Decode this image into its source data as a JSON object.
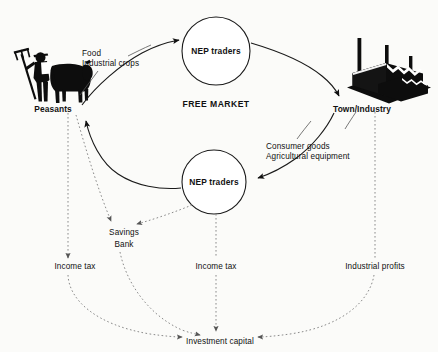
{
  "diagram": {
    "colors": {
      "ink": "#111111",
      "line": "#1a1a1a",
      "dotted": "#8a8a8a",
      "background": "#fbfbf9"
    },
    "center_label": "FREE MARKET",
    "nodes": {
      "peasants": "Peasants",
      "town_industry": "Town/Industry",
      "nep_traders_top": "NEP traders",
      "nep_traders_bottom": "NEP traders",
      "savings_bank_line1": "Savings",
      "savings_bank_line2": "Bank",
      "investment_capital": "Investment capital"
    },
    "flow_labels": {
      "food": "Food",
      "industrial_crops": "Industrial crops",
      "consumer_goods": "Consumer goods",
      "agricultural_equipment": "Agricultural equipment",
      "income_tax_left": "Income tax",
      "income_tax_center": "Income tax",
      "industrial_profits": "Industrial profits"
    },
    "icons": {
      "peasant": "peasant-with-pitchfork-and-ox-icon",
      "factory": "factory-with-smokestacks-icon"
    }
  }
}
